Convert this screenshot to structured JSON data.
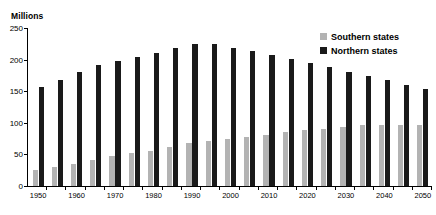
{
  "chart_data": {
    "type": "bar",
    "title": "",
    "subtitle": "",
    "xlabel": "",
    "ylabel": "Millions",
    "ylim": [
      0,
      250
    ],
    "ytick_values": [
      0,
      50,
      100,
      150,
      200,
      250
    ],
    "ytick_labels": [
      "0",
      "50",
      "100",
      "150",
      "200",
      "250"
    ],
    "grid": false,
    "legend_position": "top-right",
    "x": [
      1950,
      1955,
      1960,
      1965,
      1970,
      1975,
      1980,
      1985,
      1990,
      1995,
      2000,
      2005,
      2010,
      2015,
      2020,
      2025,
      2030,
      2035,
      2040,
      2045,
      2050
    ],
    "categories": [
      "1950",
      "1955",
      "1960",
      "1965",
      "1970",
      "1975",
      "1980",
      "1985",
      "1990",
      "1995",
      "2000",
      "2005",
      "2010",
      "2015",
      "2020",
      "2025",
      "2030",
      "2035",
      "2040",
      "2045",
      "2050"
    ],
    "xtick_labels_shown": [
      "1950",
      "1960",
      "1970",
      "1980",
      "1990",
      "2000",
      "2010",
      "2020",
      "2030",
      "2040",
      "2050"
    ],
    "series": [
      {
        "name": "Southern states",
        "color": "#b3b3b3",
        "values": [
          25,
          30,
          35,
          41,
          47,
          52,
          56,
          62,
          68,
          72,
          75,
          78,
          81,
          85,
          89,
          91,
          94,
          96,
          97,
          97,
          97
        ]
      },
      {
        "name": "Northern states",
        "color": "#1a1a1a",
        "values": [
          156,
          168,
          180,
          191,
          198,
          204,
          211,
          218,
          225,
          224,
          219,
          213,
          207,
          201,
          195,
          188,
          181,
          174,
          167,
          160,
          154
        ]
      }
    ]
  },
  "legend": {
    "items": [
      {
        "label": "Southern states",
        "swatch": "southern"
      },
      {
        "label": "Northern states",
        "swatch": "northern"
      }
    ]
  }
}
